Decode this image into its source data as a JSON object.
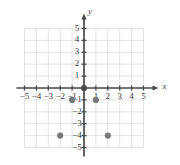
{
  "chart_data": {
    "type": "scatter",
    "title": "",
    "xlabel": "x",
    "ylabel": "y",
    "xlim": [
      -5.5,
      5.5
    ],
    "ylim": [
      -5.5,
      5.5
    ],
    "grid": true,
    "legend": null,
    "x_ticks": [
      -5,
      -4,
      -3,
      -2,
      -1,
      1,
      2,
      3,
      4,
      5
    ],
    "y_ticks": [
      5,
      4,
      3,
      2,
      1,
      -1,
      -2,
      -3,
      -4,
      -5
    ],
    "x_tick_labels": [
      "−5",
      "−4",
      "−3",
      "−2",
      "−1",
      "1",
      "2",
      "3",
      "4",
      "5"
    ],
    "y_tick_labels": [
      "5",
      "4",
      "3",
      "2",
      "1",
      "−1",
      "−2",
      "−3",
      "−4",
      "−5"
    ],
    "points": [
      {
        "x": 0,
        "y": 0
      },
      {
        "x": -1,
        "y": -1
      },
      {
        "x": 1,
        "y": -1
      },
      {
        "x": -2,
        "y": -4
      },
      {
        "x": 2,
        "y": -4
      }
    ],
    "colors": {
      "grid": "#dcdcdc",
      "axis": "#4a4a4a",
      "point": "#7a7a7a",
      "point_origin": "#4a4a4a",
      "label": "#3d3d3d",
      "background": "#ffffff"
    },
    "point_radius": 3.1
  }
}
